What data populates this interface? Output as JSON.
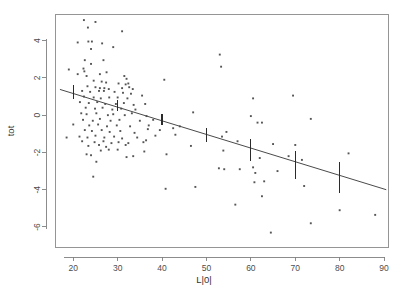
{
  "chart_data": {
    "type": "scatter",
    "title": "",
    "subtitle": "",
    "xlabel": "L|0|",
    "ylabel": "tot",
    "xlim": [
      16,
      91
    ],
    "ylim": [
      -7.1,
      5.4
    ],
    "xticks": [
      20,
      30,
      40,
      50,
      60,
      70,
      80,
      90
    ],
    "yticks": [
      4,
      2,
      0,
      -2,
      -4,
      -6
    ],
    "xtick_labels": [
      "20",
      "30",
      "40",
      "50",
      "60",
      "70",
      "80",
      "90"
    ],
    "ytick_labels": [
      "4",
      "2",
      "0",
      "-2",
      "-4",
      "-6"
    ],
    "grid": false,
    "legend": null,
    "point_color": "#555555",
    "line_color": "#4a4a4a",
    "errorbar_color": "#2b2b2b",
    "axis_color": "#808080",
    "background": "#ffffff",
    "series": [
      {
        "name": "observations",
        "marker": "square",
        "points": [
          [
            22.4,
            5.1
          ],
          [
            25.0,
            5.0
          ],
          [
            23.3,
            4.7
          ],
          [
            31.0,
            4.5
          ],
          [
            21.0,
            3.9
          ],
          [
            23.4,
            3.95
          ],
          [
            24.2,
            3.95
          ],
          [
            26.5,
            3.85
          ],
          [
            29.0,
            3.65
          ],
          [
            24.0,
            3.55
          ],
          [
            53.0,
            3.25
          ],
          [
            22.6,
            2.95
          ],
          [
            26.8,
            2.95
          ],
          [
            24.0,
            2.75
          ],
          [
            53.3,
            2.6
          ],
          [
            19.0,
            2.45
          ],
          [
            22.3,
            2.5
          ],
          [
            22.5,
            2.35
          ],
          [
            27.5,
            2.3
          ],
          [
            21.0,
            2.2
          ],
          [
            23.0,
            2.1
          ],
          [
            26.0,
            2.2
          ],
          [
            31.5,
            2.1
          ],
          [
            32.0,
            1.95
          ],
          [
            40.5,
            1.9
          ],
          [
            24.6,
            1.85
          ],
          [
            26.4,
            1.8
          ],
          [
            27.4,
            1.75
          ],
          [
            30.2,
            1.7
          ],
          [
            31.8,
            1.65
          ],
          [
            32.4,
            1.7
          ],
          [
            23.2,
            1.55
          ],
          [
            25.0,
            1.5
          ],
          [
            26.0,
            1.45
          ],
          [
            27.0,
            1.45
          ],
          [
            28.0,
            1.4
          ],
          [
            31.0,
            1.45
          ],
          [
            32.6,
            1.5
          ],
          [
            33.4,
            1.4
          ],
          [
            22.0,
            1.3
          ],
          [
            23.8,
            1.25
          ],
          [
            25.8,
            1.3
          ],
          [
            26.9,
            1.3
          ],
          [
            29.3,
            1.25
          ],
          [
            31.2,
            1.2
          ],
          [
            33.0,
            1.15
          ],
          [
            69.5,
            1.05
          ],
          [
            60.5,
            0.9
          ],
          [
            22.4,
            1.0
          ],
          [
            24.6,
            0.95
          ],
          [
            26.2,
            0.9
          ],
          [
            28.1,
            0.95
          ],
          [
            30.0,
            0.95
          ],
          [
            32.2,
            0.9
          ],
          [
            35.5,
            1.05
          ],
          [
            21.5,
            0.7
          ],
          [
            23.5,
            0.65
          ],
          [
            25.4,
            0.7
          ],
          [
            27.2,
            0.6
          ],
          [
            29.6,
            0.6
          ],
          [
            31.4,
            0.65
          ],
          [
            33.6,
            0.55
          ],
          [
            36.2,
            0.6
          ],
          [
            22.8,
            0.4
          ],
          [
            24.9,
            0.35
          ],
          [
            26.6,
            0.4
          ],
          [
            28.8,
            0.3
          ],
          [
            30.8,
            0.35
          ],
          [
            34.0,
            0.3
          ],
          [
            47.0,
            0.15
          ],
          [
            21.8,
            0.1
          ],
          [
            23.0,
            0.05
          ],
          [
            25.2,
            0.1
          ],
          [
            27.8,
            0.0
          ],
          [
            29.0,
            0.05
          ],
          [
            31.6,
            0.0
          ],
          [
            33.2,
            0.1
          ],
          [
            36.5,
            -0.05
          ],
          [
            60.0,
            -0.05
          ],
          [
            73.5,
            -0.2
          ],
          [
            22.2,
            -0.25
          ],
          [
            24.4,
            -0.3
          ],
          [
            26.0,
            -0.2
          ],
          [
            28.4,
            -0.3
          ],
          [
            30.4,
            -0.25
          ],
          [
            35.0,
            -0.3
          ],
          [
            38.0,
            -0.25
          ],
          [
            44.0,
            -0.6
          ],
          [
            61.5,
            -0.4
          ],
          [
            62.5,
            -0.4
          ],
          [
            20.0,
            -0.5
          ],
          [
            23.6,
            -0.55
          ],
          [
            25.6,
            -0.5
          ],
          [
            27.6,
            -0.6
          ],
          [
            29.8,
            -0.55
          ],
          [
            32.8,
            -0.6
          ],
          [
            37.0,
            -0.55
          ],
          [
            42.5,
            -0.7
          ],
          [
            54.5,
            -0.9
          ],
          [
            22.6,
            -0.8
          ],
          [
            24.2,
            -0.85
          ],
          [
            26.4,
            -0.8
          ],
          [
            28.2,
            -0.9
          ],
          [
            30.6,
            -0.85
          ],
          [
            33.8,
            -0.95
          ],
          [
            36.8,
            -0.75
          ],
          [
            39.5,
            -0.8
          ],
          [
            53.5,
            -1.15
          ],
          [
            18.5,
            -1.2
          ],
          [
            21.4,
            -1.15
          ],
          [
            23.2,
            -1.2
          ],
          [
            25.0,
            -1.1
          ],
          [
            27.0,
            -1.2
          ],
          [
            29.2,
            -1.15
          ],
          [
            31.0,
            -1.25
          ],
          [
            34.4,
            -1.2
          ],
          [
            38.5,
            -1.1
          ],
          [
            43.0,
            -1.05
          ],
          [
            22.0,
            -1.4
          ],
          [
            24.8,
            -1.45
          ],
          [
            26.8,
            -1.4
          ],
          [
            28.6,
            -1.5
          ],
          [
            30.2,
            -1.45
          ],
          [
            32.4,
            -1.5
          ],
          [
            35.8,
            -1.45
          ],
          [
            36.4,
            -1.35
          ],
          [
            57.0,
            -1.4
          ],
          [
            65.0,
            -1.55
          ],
          [
            70.0,
            -1.6
          ],
          [
            23.4,
            -1.65
          ],
          [
            25.8,
            -1.6
          ],
          [
            27.4,
            -1.7
          ],
          [
            31.8,
            -1.6
          ],
          [
            23.0,
            -2.1
          ],
          [
            24.0,
            -2.15
          ],
          [
            26.2,
            -1.9
          ],
          [
            28.0,
            -1.85
          ],
          [
            30.0,
            -1.85
          ],
          [
            32.0,
            -2.25
          ],
          [
            36.0,
            -1.95
          ],
          [
            41.0,
            -2.1
          ],
          [
            46.5,
            -1.65
          ],
          [
            53.8,
            -1.9
          ],
          [
            25.2,
            -2.5
          ],
          [
            33.5,
            -2.2
          ],
          [
            62.0,
            -2.3
          ],
          [
            68.5,
            -2.2
          ],
          [
            71.5,
            -2.4
          ],
          [
            82.0,
            -2.05
          ],
          [
            24.5,
            -3.3
          ],
          [
            54.0,
            -2.9
          ],
          [
            57.5,
            -2.9
          ],
          [
            60.5,
            -2.8
          ],
          [
            52.8,
            -2.85
          ],
          [
            66.0,
            -3.0
          ],
          [
            61.0,
            -3.1
          ],
          [
            63.0,
            -3.55
          ],
          [
            60.8,
            -3.6
          ],
          [
            72.0,
            -3.8
          ],
          [
            40.8,
            -3.95
          ],
          [
            47.5,
            -3.85
          ],
          [
            62.5,
            -4.35
          ],
          [
            56.5,
            -4.8
          ],
          [
            80.0,
            -5.1
          ],
          [
            73.5,
            -5.8
          ],
          [
            88.0,
            -5.35
          ],
          [
            64.5,
            -6.3
          ]
        ]
      }
    ],
    "fit_line": {
      "name": "linear-fit",
      "x_start": 17.0,
      "y_start": 1.38,
      "x_end": 90.5,
      "y_end": -4.0,
      "slope": -0.0732,
      "intercept": 2.625
    },
    "error_bars": [
      {
        "x": 20.0,
        "y": 1.22,
        "low": 0.88,
        "high": 1.62
      },
      {
        "x": 30.0,
        "y": 0.5,
        "low": 0.22,
        "high": 0.82
      },
      {
        "x": 40.0,
        "y": -0.25,
        "low": -0.52,
        "high": 0.05
      },
      {
        "x": 50.0,
        "y": -1.05,
        "low": -1.42,
        "high": -0.7
      },
      {
        "x": 60.0,
        "y": -1.85,
        "low": -2.45,
        "high": -1.3
      },
      {
        "x": 70.0,
        "y": -2.62,
        "low": -3.4,
        "high": -1.9
      },
      {
        "x": 80.0,
        "y": -3.35,
        "low": -4.2,
        "high": -2.5
      }
    ]
  }
}
